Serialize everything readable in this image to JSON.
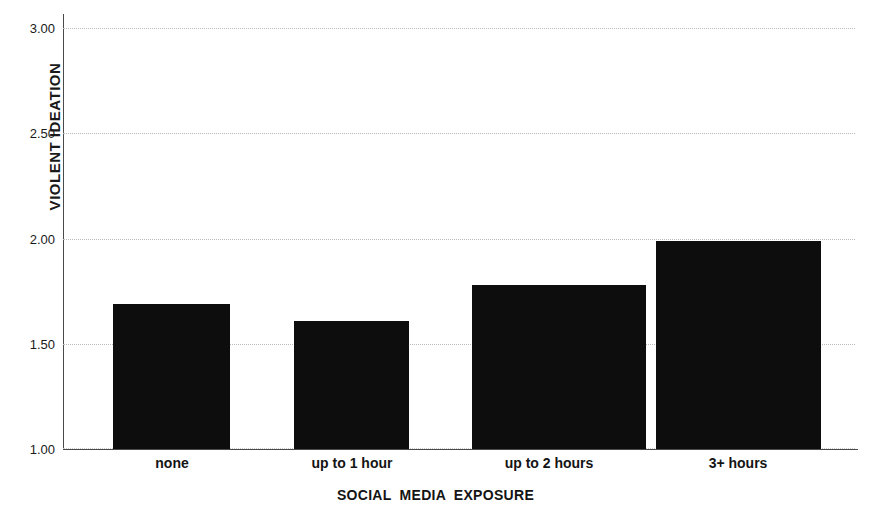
{
  "chart_data": {
    "type": "bar",
    "title": "",
    "xlabel": "SOCIAL MEDIA EXPOSURE",
    "ylabel": "VIOLENT IDEATION",
    "categories": [
      "none",
      "up to 1 hour",
      "up to 2 hours",
      "3+ hours"
    ],
    "values": [
      1.69,
      1.61,
      1.78,
      1.99
    ],
    "ylim": [
      1.0,
      3.0
    ],
    "yticks": [
      "1.00",
      "1.50",
      "2.00",
      "2.50",
      "3.00"
    ],
    "ytick_values": [
      1.0,
      1.5,
      2.0,
      2.5,
      3.0
    ],
    "grid": true,
    "legend": "none",
    "bar_color": "#0d0d0d",
    "background_color": "#ffffff",
    "gridline_color": "#b9b9b9",
    "axis_color": "#4a4a4a"
  }
}
